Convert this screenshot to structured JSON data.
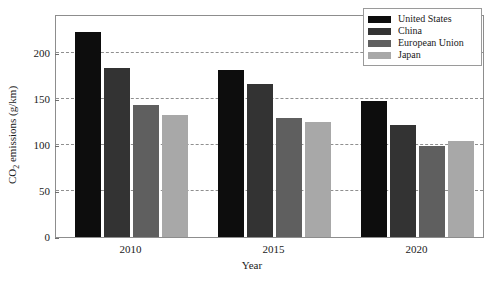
{
  "chart_data": {
    "type": "bar",
    "title": "",
    "xlabel": "Year",
    "ylabel": "CO2 emissions (g/km)",
    "categories": [
      "2010",
      "2015",
      "2020"
    ],
    "series": [
      {
        "name": "United States",
        "color": "#0d0d0d",
        "values": [
          223,
          181,
          148
        ]
      },
      {
        "name": "China",
        "color": "#333333",
        "values": [
          183,
          166,
          122
        ]
      },
      {
        "name": "European Union",
        "color": "#5f5f5f",
        "values": [
          143,
          129,
          99
        ]
      },
      {
        "name": "Japan",
        "color": "#a8a8a8",
        "values": [
          132,
          125,
          104
        ]
      }
    ],
    "ylim": [
      0,
      242
    ],
    "yticks": [
      0,
      50,
      100,
      150,
      200
    ],
    "ytick_labels": [
      "0",
      "50",
      "100",
      "150",
      "200"
    ],
    "grid": true,
    "grid_axis": "y",
    "grid_style": "dashed",
    "legend_position": "top-right",
    "legend_entries": [
      "United States",
      "China",
      "European Union",
      "Japan"
    ]
  },
  "axis": {
    "ylabel_prefix": "CO",
    "ylabel_sub": "2",
    "ylabel_suffix": " emissions (g/km)",
    "xlabel": "Year"
  }
}
